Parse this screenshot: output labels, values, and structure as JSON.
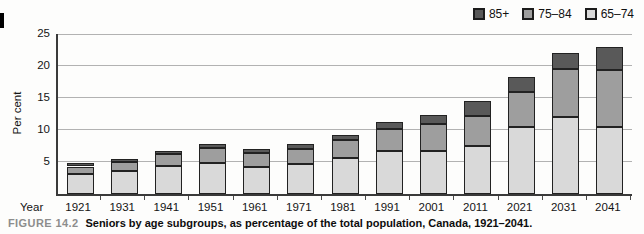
{
  "figure": {
    "label": "FIGURE 14.2",
    "caption": "Seniors by age subgroups, as percentage of the total population, Canada, 1921–2041."
  },
  "chart_data": {
    "type": "bar",
    "stacked": true,
    "xlabel": "Year",
    "ylabel": "Per cent",
    "ylim": [
      0,
      25
    ],
    "yticks": [
      5,
      10,
      15,
      20,
      25
    ],
    "grid": true,
    "categories": [
      "1921",
      "1931",
      "1941",
      "1951",
      "1961",
      "1971",
      "1981",
      "1991",
      "2001",
      "2011",
      "2021",
      "2031",
      "2041"
    ],
    "series": [
      {
        "name": "65–74",
        "color": "#d9d9d9",
        "values": [
          3.1,
          3.6,
          4.3,
          4.8,
          4.2,
          4.7,
          5.6,
          6.7,
          6.7,
          7.5,
          10.4,
          12.0,
          10.4
        ]
      },
      {
        "name": "75–84",
        "color": "#9e9e9e",
        "values": [
          1.2,
          1.4,
          1.9,
          2.4,
          2.2,
          2.4,
          2.8,
          3.4,
          4.2,
          4.7,
          5.5,
          7.6,
          9.0
        ]
      },
      {
        "name": "85+",
        "color": "#595959",
        "values": [
          0.5,
          0.5,
          0.5,
          0.6,
          0.6,
          0.7,
          0.8,
          1.1,
          1.5,
          2.3,
          2.4,
          2.5,
          3.6
        ]
      }
    ],
    "totals": [
      4.8,
      5.5,
      6.7,
      7.8,
      7.0,
      7.8,
      9.2,
      11.2,
      12.4,
      14.5,
      18.3,
      22.1,
      23.0
    ],
    "legend": {
      "position": "top-right",
      "order": [
        "85+",
        "75–84",
        "65–74"
      ]
    }
  }
}
